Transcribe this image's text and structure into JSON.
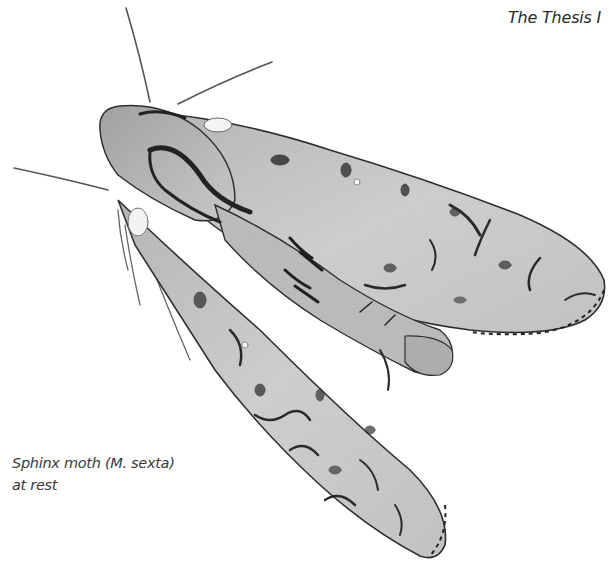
{
  "header": {
    "title": "The Thesis I"
  },
  "figure": {
    "style": "pencil drawing, grayscale",
    "caption": {
      "line1": "Sphinx moth (M. sexta)",
      "line2": "at rest"
    }
  },
  "colors": {
    "background": "#ffffff",
    "wing_fill": "#d4d4d4",
    "outline": "#2b2b2b",
    "markings": "#3a3a3a",
    "text": "#333333"
  }
}
